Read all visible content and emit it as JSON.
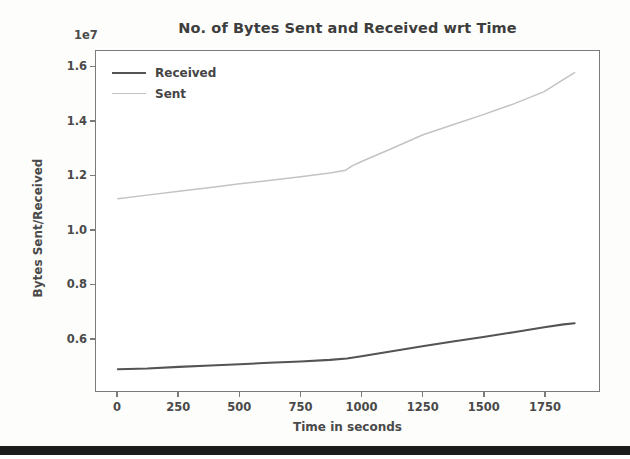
{
  "figure": {
    "title": "No. of Bytes Sent and Received wrt Time",
    "y_offset_text": "1e7",
    "x_axis_label": "Time in seconds",
    "y_axis_label": "Bytes Sent/Received",
    "background_color": "#ffffff",
    "frame_color": "#7b7b7b"
  },
  "legend": {
    "position": "upper left",
    "entries": [
      {
        "label": "Received",
        "color": "#545454"
      },
      {
        "label": "Sent",
        "color": "#c3c3c3"
      }
    ]
  },
  "chart_data": {
    "type": "line",
    "title": "No. of Bytes Sent and Received wrt Time",
    "subtitle": "",
    "xlabel": "Time in seconds",
    "ylabel": "Bytes Sent/Received",
    "y_offset_text": "1e7",
    "y_scale_multiplier": 10000000,
    "xlim": [
      -90,
      1975
    ],
    "ylim": [
      4050000,
      16600000
    ],
    "xticks": [
      0,
      250,
      500,
      750,
      1000,
      1250,
      1500,
      1750
    ],
    "xticklabels": [
      "0",
      "250",
      "500",
      "750",
      "1000",
      "1250",
      "1500",
      "1750"
    ],
    "yticks": [
      6000000,
      8000000,
      10000000,
      12000000,
      14000000,
      16000000
    ],
    "yticklabels": [
      "0.6",
      "0.8",
      "1.0",
      "1.2",
      "1.4",
      "1.6"
    ],
    "grid": false,
    "legend_position": "upper left",
    "series": [
      {
        "name": "Received",
        "color": "#545454",
        "linewidth": 2.1,
        "x": [
          0,
          120,
          250,
          380,
          500,
          620,
          750,
          870,
          940,
          1000,
          1125,
          1250,
          1375,
          1500,
          1625,
          1750,
          1830,
          1875
        ],
        "values": [
          4850000,
          4880000,
          4940000,
          4990000,
          5040000,
          5090000,
          5140000,
          5200000,
          5250000,
          5330000,
          5520000,
          5700000,
          5880000,
          6040000,
          6220000,
          6400000,
          6510000,
          6550000
        ]
      },
      {
        "name": "Sent",
        "color": "#c3c3c3",
        "linewidth": 1.5,
        "x": [
          0,
          120,
          250,
          380,
          500,
          620,
          750,
          870,
          935,
          960,
          1000,
          1125,
          1250,
          1375,
          1500,
          1625,
          1750,
          1830,
          1875
        ],
        "values": [
          11150000,
          11280000,
          11420000,
          11560000,
          11700000,
          11820000,
          11960000,
          12100000,
          12200000,
          12350000,
          12520000,
          13000000,
          13500000,
          13880000,
          14250000,
          14650000,
          15100000,
          15550000,
          15800000
        ]
      }
    ],
    "annotations": [
      {
        "text": "Sent series changes to a steeper slope near t = 940 s",
        "x": 940,
        "y": 12250000
      }
    ]
  },
  "axes_geometry": {
    "plot_left_px": 95,
    "plot_top_px": 50,
    "plot_width_px": 505,
    "plot_height_px": 342
  }
}
